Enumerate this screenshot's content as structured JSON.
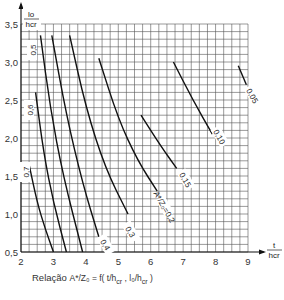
{
  "chart_data": {
    "type": "line",
    "xlabel": "t/hcr",
    "ylabel": "lo/hcr",
    "xlim": [
      2,
      9
    ],
    "ylim": [
      0.5,
      3.5
    ],
    "grid": true,
    "x_ticks": [
      "2",
      "3",
      "4",
      "5",
      "6",
      "7",
      "8",
      "9"
    ],
    "y_ticks": [
      "0,5",
      "1,0",
      "1,5",
      "2,0",
      "2,5",
      "3,0",
      "3,5"
    ],
    "series": [
      {
        "name": "0.7",
        "points": [
          [
            2.25,
            1.65
          ],
          [
            2.5,
            1.15
          ],
          [
            2.75,
            0.8
          ],
          [
            3.0,
            0.5
          ]
        ]
      },
      {
        "name": "0.6",
        "points": [
          [
            2.45,
            2.6
          ],
          [
            2.7,
            1.8
          ],
          [
            3.0,
            1.15
          ],
          [
            3.4,
            0.5
          ]
        ]
      },
      {
        "name": "0.5",
        "points": [
          [
            2.6,
            3.35
          ],
          [
            2.9,
            2.4
          ],
          [
            3.3,
            1.5
          ],
          [
            3.9,
            0.5
          ]
        ]
      },
      {
        "name": "0.4",
        "points": [
          [
            2.95,
            3.35
          ],
          [
            3.4,
            2.3
          ],
          [
            3.9,
            1.4
          ],
          [
            4.4,
            0.7
          ]
        ]
      },
      {
        "name": "0.3",
        "points": [
          [
            3.5,
            3.35
          ],
          [
            4.0,
            2.4
          ],
          [
            4.6,
            1.6
          ],
          [
            5.3,
            1.0
          ]
        ]
      },
      {
        "name": "0.2",
        "points": [
          [
            4.4,
            3.05
          ],
          [
            5.0,
            2.25
          ],
          [
            5.6,
            1.7
          ],
          [
            6.2,
            1.3
          ]
        ]
      },
      {
        "name": "0.15",
        "points": [
          [
            5.7,
            2.3
          ],
          [
            6.3,
            1.9
          ],
          [
            6.8,
            1.6
          ]
        ]
      },
      {
        "name": "0.10",
        "points": [
          [
            6.7,
            3.0
          ],
          [
            7.3,
            2.5
          ],
          [
            7.9,
            2.05
          ]
        ]
      },
      {
        "name": "0.05",
        "points": [
          [
            8.7,
            2.95
          ],
          [
            8.95,
            2.7
          ]
        ]
      }
    ],
    "annotations": [
      "0.5",
      "0.6",
      "0.7",
      "0,4",
      "0,3",
      "A*/Zo = 0,2",
      "0,15",
      "0,10",
      "0,05"
    ]
  },
  "caption": {
    "prefix": "Relação",
    "formula": "A*/Zo = f(t/hcr, lo/hcr)"
  },
  "axis_labels": {
    "y_num": "lo",
    "y_den": "hcr",
    "x_num": "t",
    "x_den": "hcr"
  },
  "curve_labels": {
    "c05": "0,5",
    "c06": "0,6",
    "c07": "0,7",
    "c04": "0,4",
    "c03": "0,3",
    "c02": "0,2",
    "c015": "0,15",
    "c010": "0,10",
    "c005": "0,05",
    "az": "A*"
  }
}
